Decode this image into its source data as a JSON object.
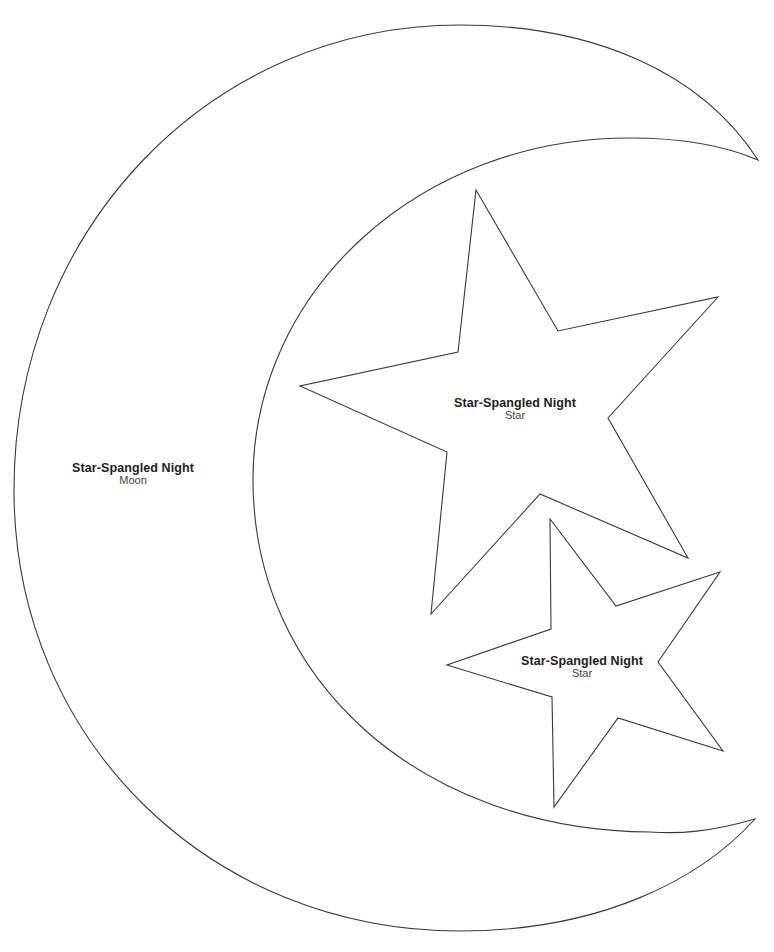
{
  "template": {
    "stroke_color": "#3a3a3a",
    "background_color": "#ffffff"
  },
  "pieces": {
    "moon": {
      "title": "Star-Spangled Night",
      "subtitle": "Moon"
    },
    "star_large": {
      "title": "Star-Spangled Night",
      "subtitle": "Star"
    },
    "star_small": {
      "title": "Star-Spangled Night",
      "subtitle": "Star"
    }
  }
}
